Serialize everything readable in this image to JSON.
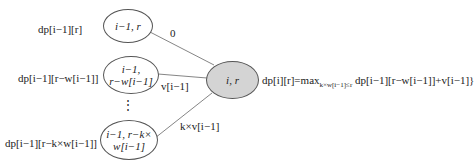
{
  "left_labels": [
    "dp[i−1][r]",
    "dp[i−1][r−w[i−1]]",
    "dp[i−1][r−k×w[i−1]]"
  ],
  "nodes": {
    "top": {
      "line1": "i−1,  r",
      "line2": ""
    },
    "middle": {
      "line1": "i−1,",
      "line2": "r−w[i−1]"
    },
    "bottom": {
      "line1": "i−1, r−k×",
      "line2": "w[i−1]"
    },
    "center": {
      "line1": "i,  r"
    }
  },
  "edge_labels": {
    "top": "0",
    "middle": "v[i−1]",
    "bottom": "k×v[i−1]"
  },
  "ellipsis": "⋮",
  "formula": {
    "lhs": "dp[i][r]=max",
    "subscript": "k×w[i−1]≤r",
    "rhs": " dp[i−1][r−w[i−1]]+v[i−1]}"
  },
  "colors": {
    "center_fill": "#d4d4d4",
    "stroke": "#555555"
  }
}
